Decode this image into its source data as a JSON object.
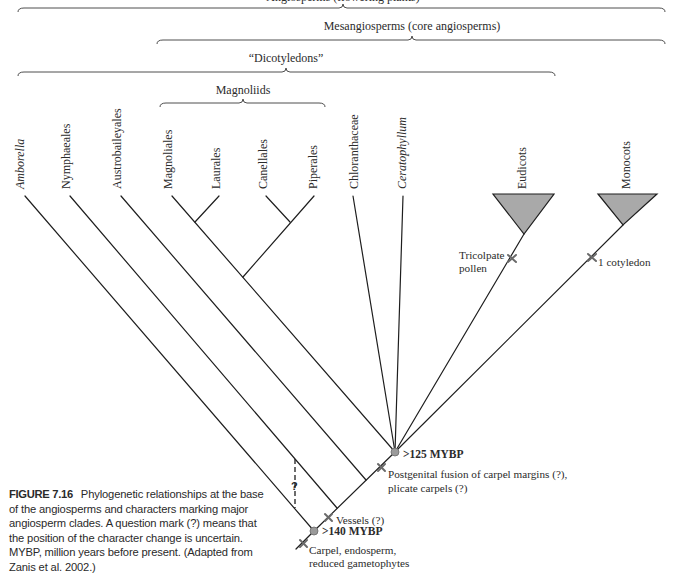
{
  "brackets": {
    "top_partial": "Angiosperms (flowering plants)",
    "mesangiosperms": "Mesangiosperms (core angiosperms)",
    "dicotyledons": "“Dicotyledons”",
    "magnoliids": "Magnoliids"
  },
  "taxa": [
    {
      "name": "Amborella",
      "italic": true
    },
    {
      "name": "Nymphaeales",
      "italic": false
    },
    {
      "name": "Austrobaileyales",
      "italic": false
    },
    {
      "name": "Magnoliales",
      "italic": false
    },
    {
      "name": "Laurales",
      "italic": false
    },
    {
      "name": "Canellales",
      "italic": false
    },
    {
      "name": "Piperales",
      "italic": false
    },
    {
      "name": "Chloranthaceae",
      "italic": false
    },
    {
      "name": "Ceratophyllum",
      "italic": true
    },
    {
      "name": "Eudicots",
      "italic": false
    },
    {
      "name": "Monocots",
      "italic": false
    }
  ],
  "nodes": {
    "root_age": ">140 MYBP",
    "mesangiosperm_age": ">125 MYBP"
  },
  "characters": {
    "tricolpate_line1": "Tricolpate",
    "tricolpate_line2": "pollen",
    "cotyledon": "1 cotyledon",
    "postgenital_line1": "Postgenital fusion of carpel margins (?),",
    "postgenital_line2": "plicate carpels (?)",
    "vessels": "Vessels (?)",
    "carpel_line1": "Carpel, endosperm,",
    "carpel_line2": "reduced gametophytes",
    "uncertain_mark": "?"
  },
  "caption": {
    "label": "FIGURE 7.16",
    "text": "Phylogenetic relationships at the base of the angiosperms and characters marking major angiosperm clades. A question mark (?) means that the position of the character change is uncertain. MYBP, million years before present. (Adapted from Zanis et al. 2002.)"
  },
  "colors": {
    "line": "#1e1e1e",
    "clade_fill": "#a9a9a9",
    "node_fill": "#9a9a9a",
    "tick": "#6a6a6a"
  }
}
